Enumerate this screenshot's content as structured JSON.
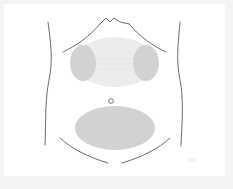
{
  "figure": {
    "canvas": {
      "width": 233,
      "height": 189,
      "background_color": "#ffffff",
      "frame_color": "#f4f4f4",
      "card_color": "#ffffff"
    },
    "outline": {
      "label": "torso outline",
      "stroke_color": "#5a5a5a",
      "stroke_width": 0.9
    },
    "regions": [
      {
        "id": "thoracic-zone",
        "label": "upper chest zone",
        "shape": "ellipse",
        "cx": 115,
        "cy": 62,
        "rx": 40,
        "ry": 25,
        "fill_color": "#ececec"
      },
      {
        "id": "left-chest-lobe",
        "label": "left chest lobe",
        "shape": "ellipse",
        "cx": 83,
        "cy": 63,
        "rx": 13,
        "ry": 18,
        "fill_color": "#d2d2d2"
      },
      {
        "id": "right-chest-lobe",
        "label": "right chest lobe",
        "shape": "ellipse",
        "cx": 146,
        "cy": 63,
        "rx": 13,
        "ry": 18,
        "fill_color": "#d2d2d2"
      },
      {
        "id": "abdominal-zone",
        "label": "lower abdominal zone",
        "shape": "ellipse",
        "cx": 115,
        "cy": 128,
        "rx": 40,
        "ry": 22,
        "fill_color": "#d2d2d2"
      }
    ],
    "markers": [
      {
        "id": "umbilicus",
        "label": "navel marker",
        "shape": "circle-outline",
        "cx": 111,
        "cy": 101,
        "r": 2.4,
        "stroke_color": "#6b6b6b",
        "fill_color": "#ffffff"
      }
    ],
    "guide_lines": [
      {
        "id": "shoulder-left",
        "label": "left shoulder contour"
      },
      {
        "id": "shoulder-right",
        "label": "right shoulder contour"
      },
      {
        "id": "neck-notch",
        "label": "sternal notch"
      },
      {
        "id": "flank-left",
        "label": "left flank waist line"
      },
      {
        "id": "flank-right",
        "label": "right flank waist line"
      },
      {
        "id": "inguinal-left",
        "label": "left groin crease"
      },
      {
        "id": "inguinal-right",
        "label": "right groin crease"
      }
    ]
  }
}
